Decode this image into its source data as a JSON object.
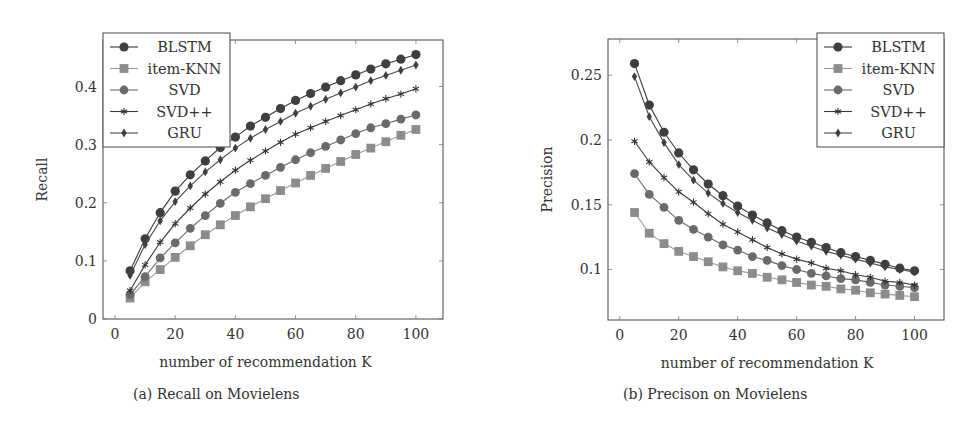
{
  "figure": {
    "captions": [
      "(a) Recall on Movielens",
      "(b) Precison on Movielens"
    ]
  },
  "legend_entries": [
    {
      "name": "BLSTM",
      "marker": "circle",
      "color": "#444444"
    },
    {
      "name": "item-KNN",
      "marker": "square",
      "color": "#8a8a8a"
    },
    {
      "name": "SVD",
      "marker": "circle",
      "color": "#666666"
    },
    {
      "name": "SVD++",
      "marker": "star",
      "color": "#333333"
    },
    {
      "name": "GRU",
      "marker": "diamond",
      "color": "#444444"
    }
  ],
  "chart_data": [
    {
      "type": "line",
      "title": "",
      "caption": "(a) Recall on Movielens",
      "xlabel": "number of recommendation K",
      "ylabel": "Recall",
      "xlim": [
        -4,
        109
      ],
      "ylim": [
        0,
        0.48
      ],
      "xticks": [
        0,
        20,
        40,
        60,
        80,
        100
      ],
      "yticks": [
        0,
        0.1,
        0.2,
        0.3,
        0.4
      ],
      "ytick_labels": [
        "0",
        "0.1",
        "0.2",
        "0.3",
        "0.4"
      ],
      "grid": false,
      "legend_position": "upper left",
      "x": [
        5,
        10,
        15,
        20,
        25,
        30,
        35,
        40,
        45,
        50,
        55,
        60,
        65,
        70,
        75,
        80,
        85,
        90,
        95,
        100
      ],
      "series": [
        {
          "name": "BLSTM",
          "values": [
            0.083,
            0.138,
            0.183,
            0.22,
            0.248,
            0.272,
            0.295,
            0.313,
            0.332,
            0.347,
            0.362,
            0.376,
            0.388,
            0.399,
            0.41,
            0.42,
            0.43,
            0.439,
            0.447,
            0.455
          ]
        },
        {
          "name": "item-KNN",
          "values": [
            0.036,
            0.064,
            0.085,
            0.106,
            0.126,
            0.145,
            0.162,
            0.178,
            0.193,
            0.207,
            0.221,
            0.234,
            0.247,
            0.259,
            0.271,
            0.283,
            0.294,
            0.305,
            0.316,
            0.326
          ]
        },
        {
          "name": "SVD",
          "values": [
            0.042,
            0.073,
            0.105,
            0.131,
            0.156,
            0.178,
            0.199,
            0.218,
            0.233,
            0.247,
            0.261,
            0.274,
            0.286,
            0.297,
            0.308,
            0.319,
            0.329,
            0.336,
            0.344,
            0.351
          ]
        },
        {
          "name": "SVD++",
          "values": [
            0.049,
            0.093,
            0.132,
            0.164,
            0.191,
            0.215,
            0.236,
            0.256,
            0.273,
            0.289,
            0.304,
            0.318,
            0.329,
            0.34,
            0.35,
            0.36,
            0.37,
            0.379,
            0.387,
            0.396
          ]
        },
        {
          "name": "GRU",
          "values": [
            0.075,
            0.128,
            0.169,
            0.202,
            0.229,
            0.253,
            0.274,
            0.294,
            0.311,
            0.326,
            0.34,
            0.354,
            0.366,
            0.378,
            0.389,
            0.399,
            0.41,
            0.419,
            0.428,
            0.437
          ]
        }
      ]
    },
    {
      "type": "line",
      "title": "",
      "caption": "(b) Precison on Movielens",
      "xlabel": "number of recommendation K",
      "ylabel": "Precision",
      "xlim": [
        -4,
        110
      ],
      "ylim": [
        0.061,
        0.278
      ],
      "xticks": [
        0,
        20,
        40,
        60,
        80,
        100
      ],
      "yticks": [
        0.1,
        0.15,
        0.2,
        0.25
      ],
      "ytick_labels": [
        "0.1",
        "0.15",
        "0.2",
        "0.25"
      ],
      "grid": false,
      "legend_position": "upper right",
      "x": [
        5,
        10,
        15,
        20,
        25,
        30,
        35,
        40,
        45,
        50,
        55,
        60,
        65,
        70,
        75,
        80,
        85,
        90,
        95,
        100
      ],
      "series": [
        {
          "name": "BLSTM",
          "values": [
            0.259,
            0.227,
            0.206,
            0.19,
            0.177,
            0.166,
            0.157,
            0.149,
            0.142,
            0.136,
            0.13,
            0.125,
            0.121,
            0.117,
            0.113,
            0.11,
            0.107,
            0.104,
            0.101,
            0.099
          ]
        },
        {
          "name": "item-KNN",
          "values": [
            0.144,
            0.128,
            0.12,
            0.114,
            0.11,
            0.106,
            0.102,
            0.099,
            0.097,
            0.094,
            0.092,
            0.09,
            0.088,
            0.087,
            0.085,
            0.084,
            0.082,
            0.081,
            0.08,
            0.079
          ]
        },
        {
          "name": "SVD",
          "values": [
            0.174,
            0.158,
            0.148,
            0.138,
            0.131,
            0.125,
            0.119,
            0.115,
            0.11,
            0.107,
            0.103,
            0.1,
            0.097,
            0.095,
            0.093,
            0.092,
            0.09,
            0.088,
            0.087,
            0.086
          ]
        },
        {
          "name": "SVD++",
          "values": [
            0.199,
            0.183,
            0.171,
            0.16,
            0.152,
            0.143,
            0.135,
            0.129,
            0.123,
            0.117,
            0.112,
            0.108,
            0.105,
            0.101,
            0.099,
            0.096,
            0.094,
            0.091,
            0.09,
            0.088
          ]
        },
        {
          "name": "GRU",
          "values": [
            0.249,
            0.218,
            0.198,
            0.181,
            0.169,
            0.159,
            0.151,
            0.144,
            0.138,
            0.132,
            0.127,
            0.122,
            0.118,
            0.114,
            0.111,
            0.108,
            0.105,
            0.102,
            0.1,
            0.098
          ]
        }
      ]
    }
  ]
}
